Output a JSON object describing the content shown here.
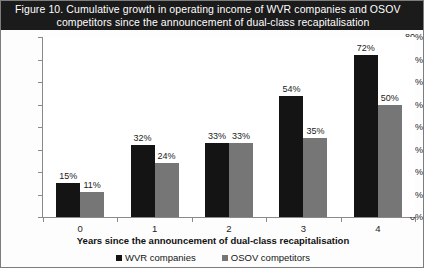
{
  "figure": {
    "title_line1": "Figure 10.  Cumulative growth in operating income of WVR companies and OSOV",
    "title_line2": "competitors since the announcement of dual-class recapitalisation"
  },
  "colors": {
    "title_band": "#1b1b1b",
    "series_wvr": "#141414",
    "series_osov": "#767676",
    "axis": "#8a8a8a",
    "plot_background": "#ffffff"
  },
  "chart_data": {
    "type": "bar",
    "title": "Figure 10.  Cumulative growth in operating income of WVR companies and OSOV competitors since the announcement of dual-class recapitalisation",
    "xlabel": "Years since the announcement of dual-class recapitalisation",
    "ylabel": "",
    "categories": [
      "0",
      "1",
      "2",
      "3",
      "4"
    ],
    "ylim": [
      0,
      80
    ],
    "ytick_labels": [
      "0%",
      "10%",
      "20%",
      "30%",
      "40%",
      "50%",
      "60%",
      "70%",
      "80%"
    ],
    "ytick_values": [
      0,
      10,
      20,
      30,
      40,
      50,
      60,
      70,
      80
    ],
    "grid": false,
    "legend_position": "bottom",
    "value_suffix": "%",
    "series": [
      {
        "name": "WVR companies",
        "color": "#141414",
        "values": [
          15,
          32,
          33,
          54,
          72
        ],
        "labels": [
          "15%",
          "32%",
          "33%",
          "54%",
          "72%"
        ]
      },
      {
        "name": "OSOV competitors",
        "color": "#767676",
        "values": [
          11,
          24,
          33,
          35,
          50
        ],
        "labels": [
          "11%",
          "24%",
          "33%",
          "35%",
          "50%"
        ]
      }
    ]
  }
}
